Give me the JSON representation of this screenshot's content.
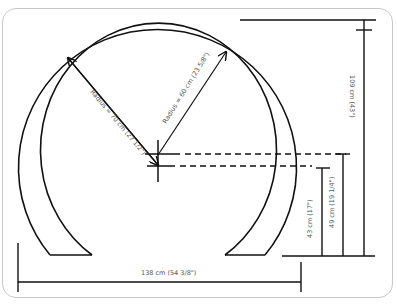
{
  "diagram": {
    "type": "dimensioned arch drawing",
    "labels": {
      "radius_outer": "Radius = 70 cm (27 1/2\")",
      "radius_inner": "Radius = 60 cm (23 5/8\")",
      "total_height": "109 cm (43\")",
      "height_49": "49 cm (19 1/4\")",
      "height_43": "43 cm (17\")",
      "width": "138 cm (54 3/8\")"
    },
    "colors": {
      "stroke": "#111111",
      "label": "#555555",
      "frame": "#c8c8c8"
    }
  }
}
